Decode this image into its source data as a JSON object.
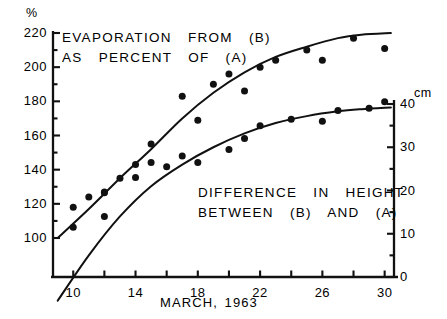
{
  "chart_data": {
    "type": "scatter",
    "title": "",
    "xlabel": "MARCH, 1963",
    "left_axis": {
      "unit_label": "%",
      "ticks": [
        100,
        120,
        140,
        160,
        180,
        200,
        220
      ],
      "ylim": [
        90,
        222
      ],
      "minor_step": 10
    },
    "right_axis": {
      "unit_label": "cm",
      "ticks": [
        0,
        10,
        20,
        30,
        40
      ],
      "ylim": [
        -6,
        41
      ],
      "minor_step": 5
    },
    "x": {
      "ticks_labeled": [
        10,
        14,
        18,
        22,
        26,
        30
      ],
      "ticks_all": [
        10,
        12,
        14,
        16,
        18,
        20,
        22,
        24,
        26,
        28,
        30
      ],
      "xlim": [
        8.7,
        30.6
      ]
    },
    "annotations": [
      {
        "name": "upper-series-annotation",
        "lines": [
          "EVAPORATION  FROM  (B)",
          "AS  PERCENT  OF  (A)"
        ]
      },
      {
        "name": "lower-series-annotation",
        "lines": [
          "DIFFERENCE  IN  HEIGHT",
          "BETWEEN  (B)  AND  (A)"
        ]
      }
    ],
    "series": [
      {
        "name": "EVAPORATION FROM (B) AS PERCENT OF (A)",
        "axis": "left",
        "unit": "%",
        "marker": "filled-circle",
        "points": [
          {
            "x": 10,
            "y": 118
          },
          {
            "x": 11,
            "y": 124
          },
          {
            "x": 12,
            "y": 127
          },
          {
            "x": 13,
            "y": 135
          },
          {
            "x": 14,
            "y": 143
          },
          {
            "x": 15,
            "y": 155
          },
          {
            "x": 17,
            "y": 183
          },
          {
            "x": 18,
            "y": 169
          },
          {
            "x": 19,
            "y": 190
          },
          {
            "x": 20,
            "y": 196
          },
          {
            "x": 21,
            "y": 186
          },
          {
            "x": 22,
            "y": 200
          },
          {
            "x": 23,
            "y": 204
          },
          {
            "x": 25,
            "y": 210
          },
          {
            "x": 26,
            "y": 204
          },
          {
            "x": 28,
            "y": 217
          },
          {
            "x": 30,
            "y": 211
          }
        ],
        "fit_curve": [
          {
            "x": 9.0,
            "y": 100
          },
          {
            "x": 11,
            "y": 117
          },
          {
            "x": 13,
            "y": 135
          },
          {
            "x": 15,
            "y": 152
          },
          {
            "x": 17,
            "y": 170
          },
          {
            "x": 19,
            "y": 185
          },
          {
            "x": 21,
            "y": 197
          },
          {
            "x": 23,
            "y": 206
          },
          {
            "x": 25,
            "y": 212
          },
          {
            "x": 27,
            "y": 217
          },
          {
            "x": 28.5,
            "y": 219
          },
          {
            "x": 30.4,
            "y": 220
          }
        ]
      },
      {
        "name": "DIFFERENCE IN HEIGHT BETWEEN (B) AND (A)",
        "axis": "right",
        "unit": "cm",
        "marker": "filled-circle",
        "points": [
          {
            "x": 10,
            "y": 11.5
          },
          {
            "x": 12,
            "y": 14.0
          },
          {
            "x": 12,
            "y": 19.5
          },
          {
            "x": 14,
            "y": 23.0
          },
          {
            "x": 15,
            "y": 26.5
          },
          {
            "x": 16,
            "y": 25.5
          },
          {
            "x": 17,
            "y": 28.0
          },
          {
            "x": 18,
            "y": 26.5
          },
          {
            "x": 20,
            "y": 29.5
          },
          {
            "x": 21,
            "y": 32.0
          },
          {
            "x": 22,
            "y": 35.0
          },
          {
            "x": 24,
            "y": 36.5
          },
          {
            "x": 26,
            "y": 36.0
          },
          {
            "x": 27,
            "y": 38.5
          },
          {
            "x": 29,
            "y": 39.0
          },
          {
            "x": 30,
            "y": 40.5
          }
        ],
        "fit_curve": [
          {
            "x": 9.0,
            "y": -5.5
          },
          {
            "x": 11,
            "y": 5.0
          },
          {
            "x": 13,
            "y": 14.0
          },
          {
            "x": 15,
            "y": 21.0
          },
          {
            "x": 17,
            "y": 26.0
          },
          {
            "x": 19,
            "y": 30.0
          },
          {
            "x": 21,
            "y": 33.2
          },
          {
            "x": 23,
            "y": 35.6
          },
          {
            "x": 25,
            "y": 37.2
          },
          {
            "x": 27,
            "y": 38.3
          },
          {
            "x": 28.5,
            "y": 38.8
          },
          {
            "x": 30.4,
            "y": 39.2
          }
        ]
      }
    ]
  },
  "labels": {
    "left_unit": "%",
    "right_unit": "cm",
    "xaxis_title": "MARCH, 1963",
    "y_left_ticks": [
      "220",
      "200",
      "180",
      "160",
      "140",
      "120",
      "100"
    ],
    "y_right_ticks": [
      "40",
      "30",
      "20",
      "10",
      "0"
    ],
    "x_ticks": [
      "10",
      "14",
      "18",
      "22",
      "26",
      "30"
    ],
    "ann_upper_1": "EVAPORATION  FROM  (B)",
    "ann_upper_2": "AS  PERCENT  OF  (A)",
    "ann_lower_1": "DIFFERENCE  IN  HEIGHT",
    "ann_lower_2": "BETWEEN  (B)  AND  (A)"
  },
  "style": {
    "ink": "#111111",
    "background": "#ffffff"
  }
}
